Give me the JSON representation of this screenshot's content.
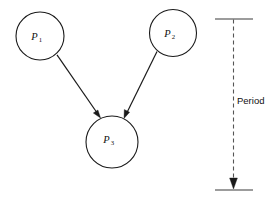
{
  "figure": {
    "type": "process-precedence-diagram",
    "background_color": "#ffffff",
    "stroke_color": "#1a1a1a",
    "dashed_color": "#555555"
  },
  "nodes": [
    {
      "id": "p1",
      "label": "P",
      "subscript": "1",
      "cx": 40,
      "cy": 36,
      "r": 24
    },
    {
      "id": "p2",
      "label": "P",
      "subscript": "2",
      "cx": 173,
      "cy": 33,
      "r": 23.5
    },
    {
      "id": "p3",
      "label": "P",
      "subscript": "3",
      "cx": 112,
      "cy": 142,
      "r": 26
    }
  ],
  "edges": [
    {
      "id": "p1-to-p3",
      "from": "p1",
      "to": "p3",
      "arrow": "solid-triangle"
    },
    {
      "id": "p2-to-p3",
      "from": "p2",
      "to": "p3",
      "arrow": "solid-triangle"
    }
  ],
  "annotation": {
    "label": "Period",
    "line_style": "dashed",
    "arrow": "down",
    "top_y": 19,
    "bottom_y": 190,
    "x": 233,
    "tick_left": 215,
    "tick_right": 253,
    "label_x": 236,
    "label_y": 104
  }
}
